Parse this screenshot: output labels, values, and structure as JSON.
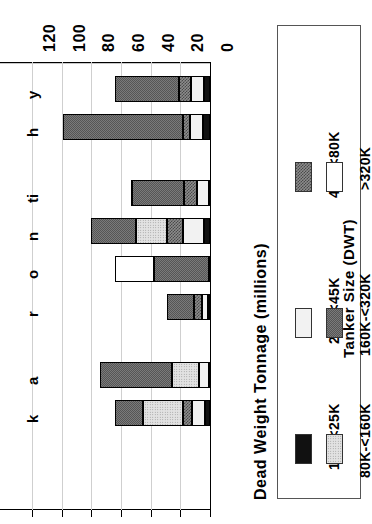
{
  "chart": {
    "type": "stacked_bar_horizontal_rotated",
    "orientation": "rotated-90-ccw",
    "axis_title": "Dead Weight Tonnage (millions)",
    "axis_ticks": [
      "0",
      "20",
      "40",
      "60",
      "80",
      "100",
      "120"
    ],
    "axis_tick_values": [
      0,
      20,
      40,
      60,
      80,
      100,
      120
    ],
    "axis_range": [
      0,
      120
    ],
    "grid": true,
    "legend_position": "right"
  },
  "legend": {
    "title": "Tanker Size (DWT)",
    "entries": [
      {
        "label": "10K-<25K",
        "key": "s10K",
        "swatch": "solid-black"
      },
      {
        "label": "25K-<45K",
        "key": "s25K",
        "swatch": "very-light-dotted"
      },
      {
        "label": "45K-<80K",
        "key": "s45K",
        "swatch": "dark-crosshatch"
      },
      {
        "label": "80K-<160K",
        "key": "s80K",
        "swatch": "light-dotted"
      },
      {
        "label": "160K-<320K",
        "key": "s160K",
        "swatch": "medium-gray-checker"
      },
      {
        "label": ">320K",
        "key": "s320K",
        "swatch": "white"
      }
    ]
  },
  "chart_data": {
    "type": "bar",
    "title": "",
    "subtitle": "",
    "xlabel": "",
    "ylabel": "Dead Weight Tonnage (millions)",
    "ylim": [
      0,
      120
    ],
    "yticks": [
      0,
      20,
      40,
      60,
      80,
      100,
      120
    ],
    "grid": true,
    "stacked": true,
    "legend_title": "Tanker Size (DWT)",
    "legend_position": "right",
    "categories": [
      "y",
      "h",
      "ti",
      "n",
      "o",
      "r",
      "a",
      "k"
    ],
    "series": [
      {
        "name": "10K-<25K",
        "values": [
          4.0,
          4.5,
          0.8,
          4.0,
          0.8,
          1.5,
          1.0,
          3.5
        ]
      },
      {
        "name": "25K-<45K",
        "values": [
          9.0,
          9.0,
          8.0,
          14.0,
          0.0,
          4.0,
          6.5,
          8.5
        ]
      },
      {
        "name": "45K-<80K",
        "values": [
          8.0,
          5.0,
          8.5,
          11.0,
          0.0,
          5.5,
          0.0,
          6.5
        ]
      },
      {
        "name": "80K-<160K",
        "values": [
          0.0,
          0.0,
          0.0,
          21.0,
          0.0,
          0.0,
          18.0,
          27.0
        ]
      },
      {
        "name": "160K-<320K",
        "values": [
          43.0,
          80.5,
          35.0,
          30.0,
          37.0,
          18.0,
          48.5,
          18.5
        ]
      },
      {
        "name": ">320K",
        "values": [
          0.0,
          0.0,
          0.7,
          0.0,
          26.4,
          0.0,
          0.0,
          0.0
        ]
      }
    ],
    "totals": [
      64,
      99,
      53,
      80,
      64.2,
      29,
      74,
      64
    ]
  },
  "bars": [
    {
      "index": 0,
      "total": 64.0,
      "segments": [
        {
          "key": "s10K",
          "value": 4.0
        },
        {
          "key": "s25K",
          "value": 9.0
        },
        {
          "key": "s45K",
          "value": 8.0
        },
        {
          "key": "s160K",
          "value": 43.0
        }
      ]
    },
    {
      "index": 1,
      "total": 99.0,
      "segments": [
        {
          "key": "s10K",
          "value": 4.5
        },
        {
          "key": "s25K",
          "value": 9.0
        },
        {
          "key": "s45K",
          "value": 5.0
        },
        {
          "key": "s160K",
          "value": 80.5
        }
      ]
    },
    {
      "index": 2,
      "total": 53.0,
      "segments": [
        {
          "key": "s10K",
          "value": 0.8
        },
        {
          "key": "s25K",
          "value": 8.0
        },
        {
          "key": "s45K",
          "value": 8.5
        },
        {
          "key": "s160K",
          "value": 35.0
        },
        {
          "key": "s320K",
          "value": 0.7
        }
      ]
    },
    {
      "index": 3,
      "total": 80.0,
      "segments": [
        {
          "key": "s10K",
          "value": 4.0
        },
        {
          "key": "s25K",
          "value": 14.0
        },
        {
          "key": "s45K",
          "value": 11.0
        },
        {
          "key": "s80K",
          "value": 21.0
        },
        {
          "key": "s160K",
          "value": 30.0
        }
      ]
    },
    {
      "index": 4,
      "total": 64.2,
      "segments": [
        {
          "key": "s10K",
          "value": 0.8
        },
        {
          "key": "s160K",
          "value": 37.0
        },
        {
          "key": "s320K",
          "value": 26.4
        }
      ]
    },
    {
      "index": 5,
      "total": 29.0,
      "segments": [
        {
          "key": "s10K",
          "value": 1.5
        },
        {
          "key": "s25K",
          "value": 4.0
        },
        {
          "key": "s45K",
          "value": 5.5
        },
        {
          "key": "s160K",
          "value": 18.0
        }
      ]
    },
    {
      "index": 6,
      "total": 74.0,
      "segments": [
        {
          "key": "s10K",
          "value": 1.0
        },
        {
          "key": "s25K",
          "value": 6.5
        },
        {
          "key": "s80K",
          "value": 18.0
        },
        {
          "key": "s160K",
          "value": 48.5
        }
      ]
    },
    {
      "index": 7,
      "total": 64.0,
      "segments": [
        {
          "key": "s10K",
          "value": 3.5
        },
        {
          "key": "s25K",
          "value": 8.5
        },
        {
          "key": "s45K",
          "value": 6.5
        },
        {
          "key": "s80K",
          "value": 27.0
        },
        {
          "key": "s160K",
          "value": 18.5
        }
      ]
    }
  ],
  "category_labels": [
    "y",
    "h",
    "ti",
    "n",
    "o",
    "r",
    "a",
    "k"
  ]
}
